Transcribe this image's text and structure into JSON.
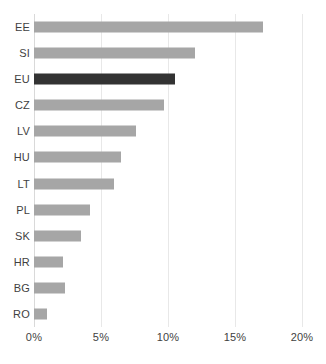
{
  "chart_data": {
    "type": "bar",
    "orientation": "horizontal",
    "title": "",
    "xlabel": "",
    "ylabel": "",
    "xlim": [
      0,
      20
    ],
    "xunit": "%",
    "grid": true,
    "legend": false,
    "tick_labels": [
      "0%",
      "5%",
      "10%",
      "15%",
      "20%"
    ],
    "tick_values": [
      0,
      5,
      10,
      15,
      20
    ],
    "categories": [
      "EE",
      "SI",
      "EU",
      "CZ",
      "LV",
      "HU",
      "LT",
      "PL",
      "SK",
      "HR",
      "BG",
      "RO"
    ],
    "values": [
      17.1,
      12.0,
      10.5,
      9.7,
      7.6,
      6.5,
      6.0,
      4.2,
      3.5,
      2.2,
      2.3,
      1.0
    ],
    "bars": [
      {
        "label": "EE",
        "value": 17.1,
        "highlight": false
      },
      {
        "label": "SI",
        "value": 12.0,
        "highlight": false
      },
      {
        "label": "EU",
        "value": 10.5,
        "highlight": true
      },
      {
        "label": "CZ",
        "value": 9.7,
        "highlight": false
      },
      {
        "label": "LV",
        "value": 7.6,
        "highlight": false
      },
      {
        "label": "HU",
        "value": 6.5,
        "highlight": false
      },
      {
        "label": "LT",
        "value": 6.0,
        "highlight": false
      },
      {
        "label": "PL",
        "value": 4.2,
        "highlight": false
      },
      {
        "label": "SK",
        "value": 3.5,
        "highlight": false
      },
      {
        "label": "HR",
        "value": 2.2,
        "highlight": false
      },
      {
        "label": "BG",
        "value": 2.3,
        "highlight": false
      },
      {
        "label": "RO",
        "value": 1.0,
        "highlight": false
      }
    ],
    "colors": {
      "bar": "#a6a6a6",
      "highlight_bar": "#333333",
      "gridline": "#e8e8e8",
      "text": "#3f3f3f",
      "background": "#ffffff"
    }
  }
}
